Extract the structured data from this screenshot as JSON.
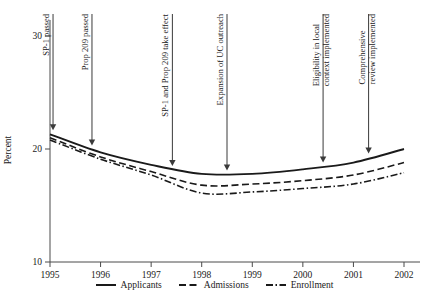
{
  "chart_data": {
    "type": "line",
    "title": "",
    "xlabel": "",
    "ylabel": "Percent",
    "xlim": [
      1995,
      2002
    ],
    "ylim": [
      10,
      30
    ],
    "yticks": [
      10,
      20,
      30
    ],
    "ytick_labels": [
      "10",
      "20",
      "30"
    ],
    "x": [
      1995,
      1996,
      1997,
      1998,
      1999,
      2000,
      2001,
      2002
    ],
    "xtick_labels": [
      "1995",
      "1996",
      "1997",
      "1998",
      "1999",
      "2000",
      "2001",
      "2002"
    ],
    "grid": false,
    "legend_position": "bottom-center",
    "series": [
      {
        "name": "Applicants",
        "style": "solid",
        "color": "#1a1a1a",
        "values": [
          21.3,
          19.7,
          18.6,
          17.8,
          17.8,
          18.2,
          18.8,
          20.0
        ]
      },
      {
        "name": "Admissions",
        "style": "dashed",
        "color": "#1a1a1a",
        "values": [
          21.0,
          19.3,
          18.0,
          16.8,
          16.9,
          17.2,
          17.7,
          18.8
        ]
      },
      {
        "name": "Enrollment",
        "style": "dash-dot",
        "color": "#1a1a1a",
        "values": [
          20.8,
          19.1,
          17.7,
          16.1,
          16.2,
          16.5,
          16.9,
          17.9
        ]
      }
    ],
    "annotations": [
      {
        "text": "SP-1 passed",
        "line2": "",
        "x": 1995.06,
        "arrow_to": 21.3
      },
      {
        "text": "Prop 209 passed",
        "line2": "",
        "x": 1995.83,
        "arrow_to": 19.95
      },
      {
        "text": "SP-1 and Prop 209 take effect",
        "line2": "",
        "x": 1997.42,
        "arrow_to": 18.15
      },
      {
        "text": "Expansion of UC outreach",
        "line2": "",
        "x": 1998.5,
        "arrow_to": 17.75
      },
      {
        "text": "Eligibility in local",
        "line2": "context implemented",
        "x": 2000.4,
        "arrow_to": 18.45
      },
      {
        "text": "Comprehensive",
        "line2": "review implemented",
        "x": 2001.3,
        "arrow_to": 19.25
      }
    ]
  }
}
